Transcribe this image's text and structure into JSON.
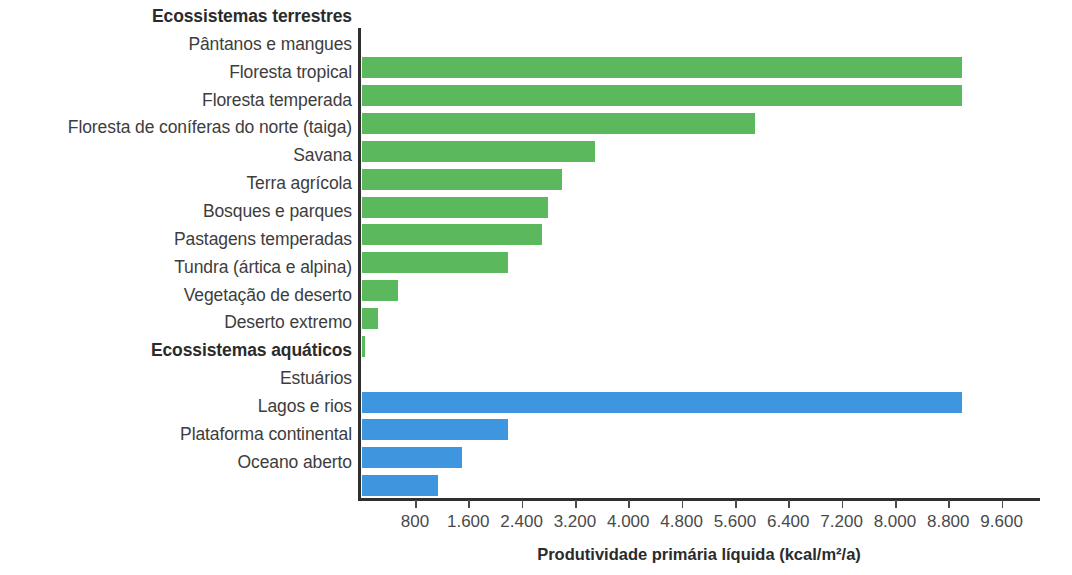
{
  "chart_data": {
    "type": "bar",
    "orientation": "horizontal",
    "title": "",
    "xlabel": "Produtividade primária líquida (kcal/m²/a)",
    "ylabel": "",
    "xlim": [
      0,
      9600
    ],
    "grid": false,
    "legend": false,
    "xticks": [
      800,
      1600,
      2400,
      3200,
      4000,
      4800,
      5600,
      6400,
      7200,
      8000,
      8800,
      9600
    ],
    "xticklabels": [
      "800",
      "1.600",
      "2.400",
      "3.200",
      "4.000",
      "4.800",
      "5.600",
      "6.400",
      "7.200",
      "8.000",
      "8.800",
      "9.600"
    ],
    "group_headings": [
      {
        "label": "Ecossistemas terrestres",
        "index": 0
      },
      {
        "label": "Ecossistemas aquáticos",
        "index": 12
      }
    ],
    "categories": [
      "Pântanos e mangues",
      "Floresta tropical",
      "Floresta temperada",
      "Floresta de coníferas do norte (taiga)",
      "Savana",
      "Terra agrícola",
      "Bosques e parques",
      "Pastagens temperadas",
      "Tundra (ártica e alpina)",
      "Vegetação de deserto",
      "Deserto extremo",
      "Estuários",
      "Lagos e rios",
      "Plataforma continental",
      "Oceano aberto"
    ],
    "values": [
      9000,
      9000,
      5900,
      3500,
      3000,
      2800,
      2700,
      2200,
      550,
      250,
      50,
      9000,
      2200,
      1500,
      1150
    ],
    "colors": [
      "#5cb85c",
      "#5cb85c",
      "#5cb85c",
      "#5cb85c",
      "#5cb85c",
      "#5cb85c",
      "#5cb85c",
      "#5cb85c",
      "#5cb85c",
      "#5cb85c",
      "#5cb85c",
      "#3d96de",
      "#3d96de",
      "#3d96de",
      "#3d96de"
    ],
    "groups": [
      "terrestre",
      "terrestre",
      "terrestre",
      "terrestre",
      "terrestre",
      "terrestre",
      "terrestre",
      "terrestre",
      "terrestre",
      "terrestre",
      "terrestre",
      "aquatico",
      "aquatico",
      "aquatico",
      "aquatico"
    ]
  },
  "rows": [
    {
      "kind": "heading",
      "label": "Ecossistemas terrestres"
    },
    {
      "kind": "bar",
      "label": "Pântanos e mangues",
      "value": 9000,
      "color": "green"
    },
    {
      "kind": "bar",
      "label": "Floresta tropical",
      "value": 9000,
      "color": "green"
    },
    {
      "kind": "bar",
      "label": "Floresta temperada",
      "value": 5900,
      "color": "green"
    },
    {
      "kind": "bar",
      "label": "Floresta de coníferas do norte (taiga)",
      "value": 3500,
      "color": "green"
    },
    {
      "kind": "bar",
      "label": "Savana",
      "value": 3000,
      "color": "green"
    },
    {
      "kind": "bar",
      "label": "Terra agrícola",
      "value": 2800,
      "color": "green"
    },
    {
      "kind": "bar",
      "label": "Bosques e parques",
      "value": 2700,
      "color": "green"
    },
    {
      "kind": "bar",
      "label": "Pastagens temperadas",
      "value": 2200,
      "color": "green"
    },
    {
      "kind": "bar",
      "label": "Tundra (ártica e alpina)",
      "value": 550,
      "color": "green"
    },
    {
      "kind": "bar",
      "label": "Vegetação de deserto",
      "value": 250,
      "color": "green"
    },
    {
      "kind": "bar",
      "label": "Deserto extremo",
      "value": 50,
      "color": "green"
    },
    {
      "kind": "heading",
      "label": "Ecossistemas aquáticos"
    },
    {
      "kind": "bar",
      "label": "Estuários",
      "value": 9000,
      "color": "blue"
    },
    {
      "kind": "bar",
      "label": "Lagos e rios",
      "value": 2200,
      "color": "blue"
    },
    {
      "kind": "bar",
      "label": "Plataforma continental",
      "value": 1500,
      "color": "blue"
    },
    {
      "kind": "bar",
      "label": "Oceano aberto",
      "value": 1150,
      "color": "blue"
    }
  ],
  "axis": {
    "title": "Produtividade primária líquida (kcal/m²/a)",
    "unit": "kcal/m²/a"
  },
  "palette": {
    "terrestrial": "#5cb85c",
    "aquatic": "#3d96de",
    "axis": "#2f2f2f",
    "text": "#3d3d3d"
  }
}
